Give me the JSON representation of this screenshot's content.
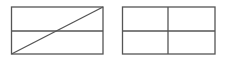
{
  "diagram": {
    "stroke_color": "#555555",
    "background": "#ffffff",
    "shapes": [
      {
        "name": "left-rectangle",
        "x": 11,
        "y": 7,
        "width": 92,
        "height": 47,
        "divisions": [
          "horizontal-midline",
          "diagonal-bottom-left-to-top-right"
        ]
      },
      {
        "name": "right-rectangle",
        "x": 122,
        "y": 7,
        "width": 93,
        "height": 47,
        "divisions": [
          "horizontal-midline",
          "vertical-midline"
        ]
      }
    ]
  }
}
